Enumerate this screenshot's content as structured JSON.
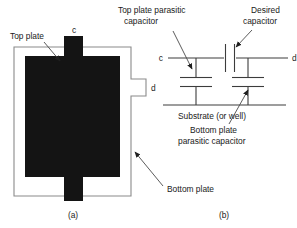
{
  "figure": {
    "captions": {
      "a": "(a)",
      "b": "(b)"
    },
    "layout_a": {
      "label_top_plate": "Top plate",
      "label_bottom_plate": "Bottom plate",
      "terminal_top": "c",
      "terminal_right": "d"
    },
    "schematic_b": {
      "label_top_parasitic": "Top plate parasitic",
      "label_top_parasitic_line2": "capacitor",
      "label_desired": "Desired",
      "label_desired_line2": "capacitor",
      "label_substrate": "Substrate (or well)",
      "label_bottom_parasitic": "Bottom plate",
      "label_bottom_parasitic_line2": "parasitic capacitor",
      "terminal_left": "c",
      "terminal_right": "d"
    },
    "colors": {
      "plate": "#141414",
      "frame": "#8a8a8a",
      "wire": "#3c3c3c",
      "text": "#1a1a1a",
      "background": "#ffffff"
    }
  }
}
